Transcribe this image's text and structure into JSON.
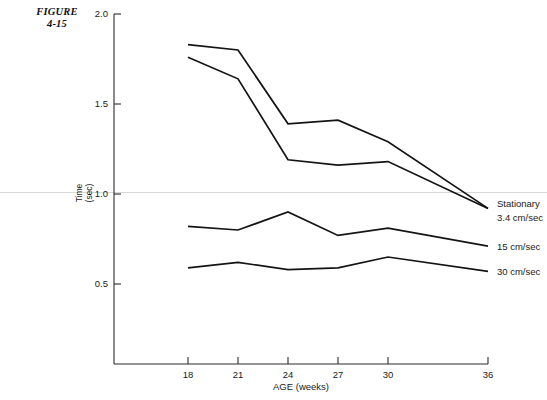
{
  "figure": {
    "caption_line1": "FIGURE",
    "caption_line2": "4-15"
  },
  "chart_data": {
    "type": "line",
    "title": "",
    "xlabel": "AGE (weeks)",
    "ylabel": "Time (sec)",
    "ylabel_line1": "Time",
    "ylabel_line2": "(sec)",
    "x": [
      18,
      21,
      24,
      27,
      30,
      36
    ],
    "xticks": [
      "18",
      "21",
      "24",
      "27",
      "30",
      "36"
    ],
    "yticks": [
      "2.0",
      "1.5",
      "1.0",
      "0.5"
    ],
    "ytick_values": [
      2.0,
      1.5,
      1.0,
      0.5
    ],
    "xlim": [
      16.5,
      36
    ],
    "ylim": [
      0.2,
      2.0
    ],
    "grid": false,
    "legend_position": "right-of-axes",
    "series": [
      {
        "name": "Stationary",
        "label": "Stationary",
        "values": [
          1.83,
          1.8,
          1.39,
          1.41,
          1.29,
          0.92
        ]
      },
      {
        "name": "3.4 cm/sec",
        "label": "3.4 cm/sec",
        "values": [
          1.76,
          1.64,
          1.19,
          1.16,
          1.18,
          0.92
        ]
      },
      {
        "name": "15 cm/sec",
        "label": "15 cm/sec",
        "values": [
          0.82,
          0.8,
          0.9,
          0.77,
          0.81,
          0.71
        ]
      },
      {
        "name": "30 cm/sec",
        "label": "30 cm/sec",
        "values": [
          0.59,
          0.62,
          0.58,
          0.59,
          0.65,
          0.57
        ]
      }
    ]
  }
}
